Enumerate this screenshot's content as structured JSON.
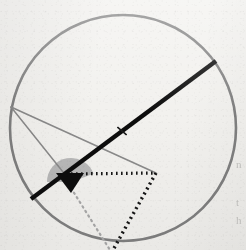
{
  "figure": {
    "width": 246,
    "height": 250,
    "background_color": "#f2f1ee"
  },
  "colors": {
    "paper": "#f2f1ee",
    "circle_stroke": "#808080",
    "thin_gray_line": "#8a8a8a",
    "chord_black": "#111111",
    "wedge_fill": "#b8b8b8",
    "arrow_black": "#0d0d0d",
    "dotted_dark": "#141414",
    "dotted_light": "#a9a9a9",
    "tick_mark": "#1a1a1a",
    "edge_text": "#9a9a98"
  },
  "circle": {
    "label": "main-circle",
    "center_x": 123,
    "center_y": 128,
    "radius": 113,
    "stroke_width": 2.6
  },
  "chord": {
    "label": "thick-chord",
    "x1": 31,
    "y1": 199,
    "x2": 216,
    "y2": 61,
    "stroke_width": 4.4,
    "tick": {
      "label": "midpoint-tick",
      "x": 122,
      "y": 131,
      "length": 11,
      "stroke_width": 1.6
    }
  },
  "vertex": {
    "label": "left-vertex",
    "x": 11,
    "y": 107
  },
  "rays": [
    {
      "name": "ray-upper-to-apex",
      "x1": 11,
      "y1": 107,
      "x2": 71,
      "y2": 182,
      "stroke_width": 1.5
    },
    {
      "name": "ray-lower-to-corner",
      "x1": 11,
      "y1": 107,
      "x2": 156,
      "y2": 173,
      "stroke_width": 1.6
    }
  ],
  "angle_wedge": {
    "label": "shaded-angle-sector",
    "center_x": 71,
    "center_y": 182,
    "radius": 24,
    "start_deg": 180,
    "end_deg": 340,
    "fill": "#b8b8b8"
  },
  "arrow_marker": {
    "label": "black-arrowhead",
    "apex_x": 71,
    "apex_y": 193,
    "left_x": 56,
    "left_y": 173,
    "right_x": 84,
    "right_y": 173
  },
  "dotted_paths": [
    {
      "name": "dotted-horizontal-top",
      "x1": 66,
      "y1": 174,
      "x2": 156,
      "y2": 173,
      "stroke_width": 3.2,
      "dash": "1.6 3.4",
      "color": "#141414"
    },
    {
      "name": "dotted-right-descender",
      "x1": 156,
      "y1": 173,
      "x2": 113,
      "y2": 250,
      "stroke_width": 3.4,
      "dash": "2.0 3.6",
      "color": "#141414"
    },
    {
      "name": "dotted-left-descender",
      "x1": 71,
      "y1": 188,
      "x2": 110,
      "y2": 250,
      "stroke_width": 2.2,
      "dash": "1.4 4.0",
      "color": "#a9a9a9"
    }
  ],
  "edge_text_fragments": [
    {
      "text": "n",
      "top": 158
    },
    {
      "text": "t",
      "top": 196
    },
    {
      "text": "h",
      "top": 214
    }
  ]
}
